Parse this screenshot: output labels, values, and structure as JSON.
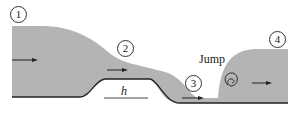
{
  "diagram": {
    "stations": [
      {
        "id": "1",
        "label": "1"
      },
      {
        "id": "2",
        "label": "2"
      },
      {
        "id": "3",
        "label": "3"
      },
      {
        "id": "4",
        "label": "4"
      }
    ],
    "jump_label": "Jump",
    "bump_height_label": "h",
    "colors": {
      "water": "#b4b4b4",
      "line": "#222222"
    }
  }
}
